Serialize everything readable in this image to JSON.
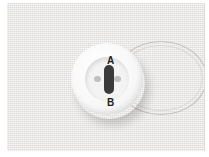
{
  "image": {
    "description": "White four-hole style button with dark thread shank and translucent thread loop on fabric",
    "labels": {
      "a": "A",
      "b": "B"
    },
    "colors": {
      "fabric": "#ecebea",
      "button": "#f7f7f7",
      "thread_dark": "#3a3a3a"
    }
  }
}
